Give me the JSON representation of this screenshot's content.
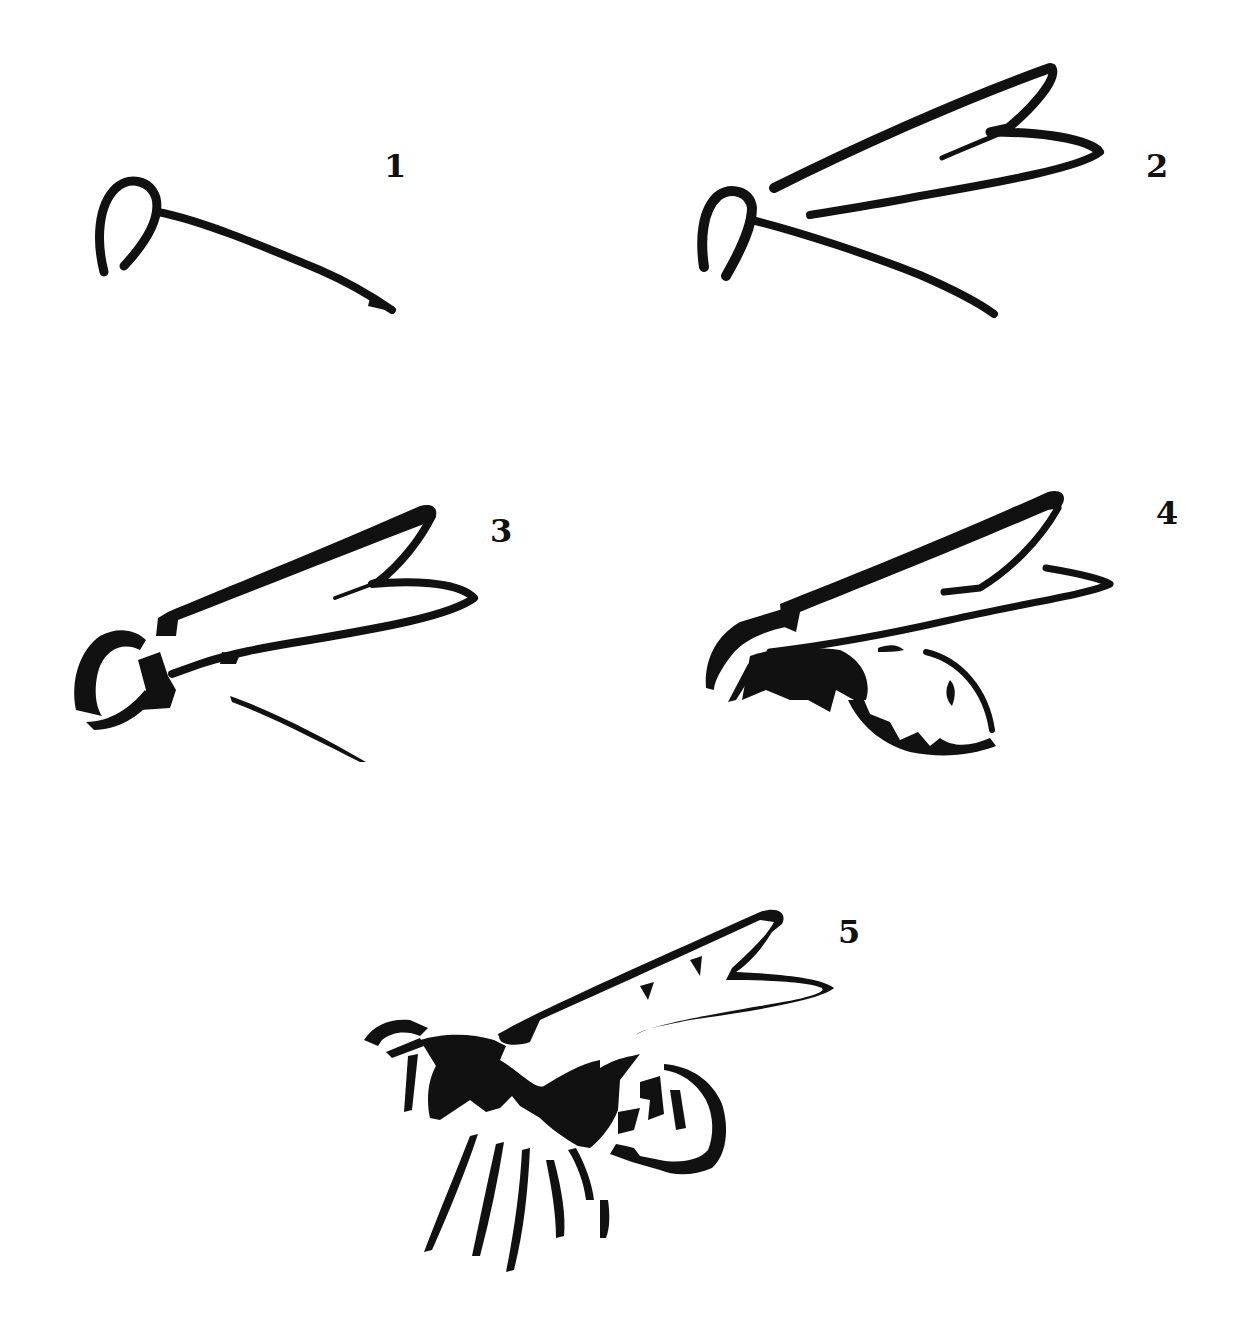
{
  "tutorial": {
    "subject": "flying bee / wasp",
    "ink_color": "#111111",
    "background_color": "#ffffff",
    "steps": [
      {
        "number": "1",
        "description": "Head loop with a long curved line for the body axis"
      },
      {
        "number": "2",
        "description": "Add the two wing outlines above the body line"
      },
      {
        "number": "3",
        "description": "Define the thorax and head shape, shorten the lower body line"
      },
      {
        "number": "4",
        "description": "Add the abdomen with stripe markings under the wings"
      },
      {
        "number": "5",
        "description": "Finished bee with legs, antennae and bold body markings"
      }
    ]
  }
}
